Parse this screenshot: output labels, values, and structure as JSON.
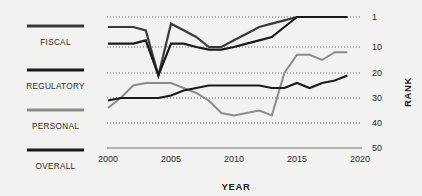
{
  "chart_data": {
    "type": "line",
    "title": "",
    "xlabel": "YEAR",
    "ylabel": "RANK",
    "xlim": [
      2000,
      2020
    ],
    "ylim": [
      1,
      50
    ],
    "y_inverted": true,
    "grid": "horizontal-dotted",
    "legend_position": "left",
    "x_ticks": [
      "2000",
      "2005",
      "2010",
      "2015",
      "2020"
    ],
    "y_ticks": [
      "1",
      "10",
      "20",
      "30",
      "40",
      "50"
    ],
    "x": [
      2000,
      2001,
      2002,
      2003,
      2004,
      2005,
      2006,
      2007,
      2008,
      2009,
      2010,
      2011,
      2012,
      2013,
      2014,
      2015,
      2016,
      2017,
      2018,
      2019
    ],
    "series": [
      {
        "name": "FISCAL",
        "color": "#3a3a3a",
        "values": [
          4,
          4,
          4,
          5,
          21,
          3,
          5,
          7,
          10,
          10,
          8,
          6,
          4,
          3,
          2,
          1,
          1,
          1,
          1,
          1
        ]
      },
      {
        "name": "REGULATORY",
        "color": "#1a1a1a",
        "values": [
          31,
          30,
          30,
          30,
          30,
          29,
          27,
          26,
          25,
          25,
          25,
          25,
          25,
          26,
          26,
          24,
          26,
          24,
          23,
          21
        ]
      },
      {
        "name": "PERSONAL",
        "color": "#8c8c8c",
        "values": [
          34,
          30,
          25,
          24,
          24,
          24,
          26,
          28,
          31,
          36,
          37,
          36,
          35,
          37,
          20,
          13,
          13,
          15,
          12,
          12
        ]
      },
      {
        "name": "OVERALL",
        "color": "#1a1a1a",
        "values": [
          9,
          9,
          9,
          8,
          21,
          9,
          9,
          10,
          11,
          11,
          10,
          9,
          8,
          7,
          4,
          1,
          1,
          1,
          1,
          1
        ]
      }
    ]
  },
  "legend": {
    "items": [
      {
        "label": "FISCAL",
        "color": "#3a3a3a"
      },
      {
        "label": "REGULATORY",
        "color": "#1a1a1a"
      },
      {
        "label": "PERSONAL",
        "color": "#8c8c8c"
      },
      {
        "label": "OVERALL",
        "color": "#1a1a1a"
      }
    ]
  },
  "axes": {
    "x_title": "YEAR",
    "y_title": "RANK"
  },
  "colors": {
    "background": "#f2f2f0",
    "text": "#262626",
    "gridline": "#5a5a5a",
    "baseline": "#6e6e6e"
  }
}
